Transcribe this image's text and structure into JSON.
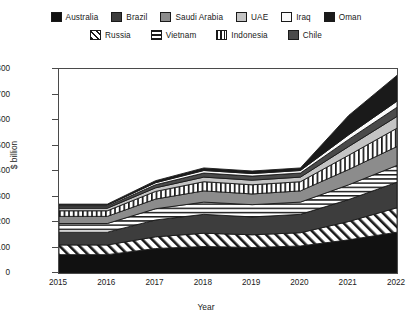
{
  "chart_data": {
    "type": "area",
    "stacked": true,
    "title": "",
    "xlabel": "Year",
    "ylabel": "$ billion",
    "x": [
      2015,
      2016,
      2017,
      2018,
      2019,
      2020,
      2021,
      2022
    ],
    "xtick_labels": [
      "2015",
      "2016",
      "2017",
      "2018",
      "2019",
      "2020",
      "2021",
      "2022"
    ],
    "ylim": [
      0,
      800
    ],
    "ytick_labels": [
      "0",
      "100",
      "200",
      "300",
      "400",
      "500",
      "600",
      "700",
      "800"
    ],
    "yticks": [
      0,
      100,
      200,
      300,
      400,
      500,
      600,
      700,
      800
    ],
    "grid": false,
    "legend_position": "top",
    "series": [
      {
        "name": "Australia",
        "pattern": "solid-black",
        "color": "#111111",
        "values": [
          72,
          72,
          96,
          104,
          100,
          106,
          130,
          160
        ]
      },
      {
        "name": "Russia",
        "pattern": "diagonal-hatch",
        "color": "#ffffff",
        "values": [
          38,
          38,
          46,
          52,
          50,
          52,
          72,
          96
        ]
      },
      {
        "name": "Brazil",
        "pattern": "solid-darkgrey",
        "color": "#3d3d3d",
        "values": [
          50,
          50,
          66,
          74,
          70,
          72,
          86,
          100
        ]
      },
      {
        "name": "Vietnam",
        "pattern": "horizontal-line",
        "color": "#ffffff",
        "values": [
          34,
          34,
          44,
          48,
          48,
          48,
          58,
          66
        ]
      },
      {
        "name": "Saudi Arabia",
        "pattern": "solid-midgrey",
        "color": "#8c8c8c",
        "values": [
          28,
          28,
          38,
          44,
          42,
          44,
          60,
          74
        ]
      },
      {
        "name": "Indonesia",
        "pattern": "vertical-line",
        "color": "#ffffff",
        "values": [
          22,
          22,
          30,
          36,
          36,
          36,
          56,
          72
        ]
      },
      {
        "name": "UAE",
        "pattern": "solid-lightgrey",
        "color": "#c4c4c4",
        "values": [
          10,
          10,
          14,
          18,
          18,
          18,
          34,
          46
        ]
      },
      {
        "name": "Chile",
        "pattern": "solid-darkgrey2",
        "color": "#4a4a4a",
        "values": [
          8,
          8,
          12,
          16,
          16,
          16,
          28,
          36
        ]
      },
      {
        "name": "Iraq",
        "pattern": "solid-white",
        "color": "#fbfbfb",
        "values": [
          4,
          4,
          8,
          10,
          10,
          10,
          18,
          24
        ]
      },
      {
        "name": "Oman",
        "pattern": "solid-black2",
        "color": "#1a1a1a",
        "values": [
          4,
          4,
          8,
          10,
          10,
          10,
          76,
          101
        ]
      }
    ],
    "totals": [
      270,
      270,
      362,
      412,
      400,
      412,
      618,
      775
    ]
  },
  "legend": {
    "row1": [
      {
        "label": "Australia"
      },
      {
        "label": "Brazil"
      },
      {
        "label": "Saudi Arabia"
      },
      {
        "label": "UAE"
      },
      {
        "label": "Iraq"
      },
      {
        "label": "Oman"
      }
    ],
    "row2": [
      {
        "label": "Russia"
      },
      {
        "label": "Vietnam"
      },
      {
        "label": "Indonesia"
      },
      {
        "label": "Chile"
      }
    ]
  }
}
